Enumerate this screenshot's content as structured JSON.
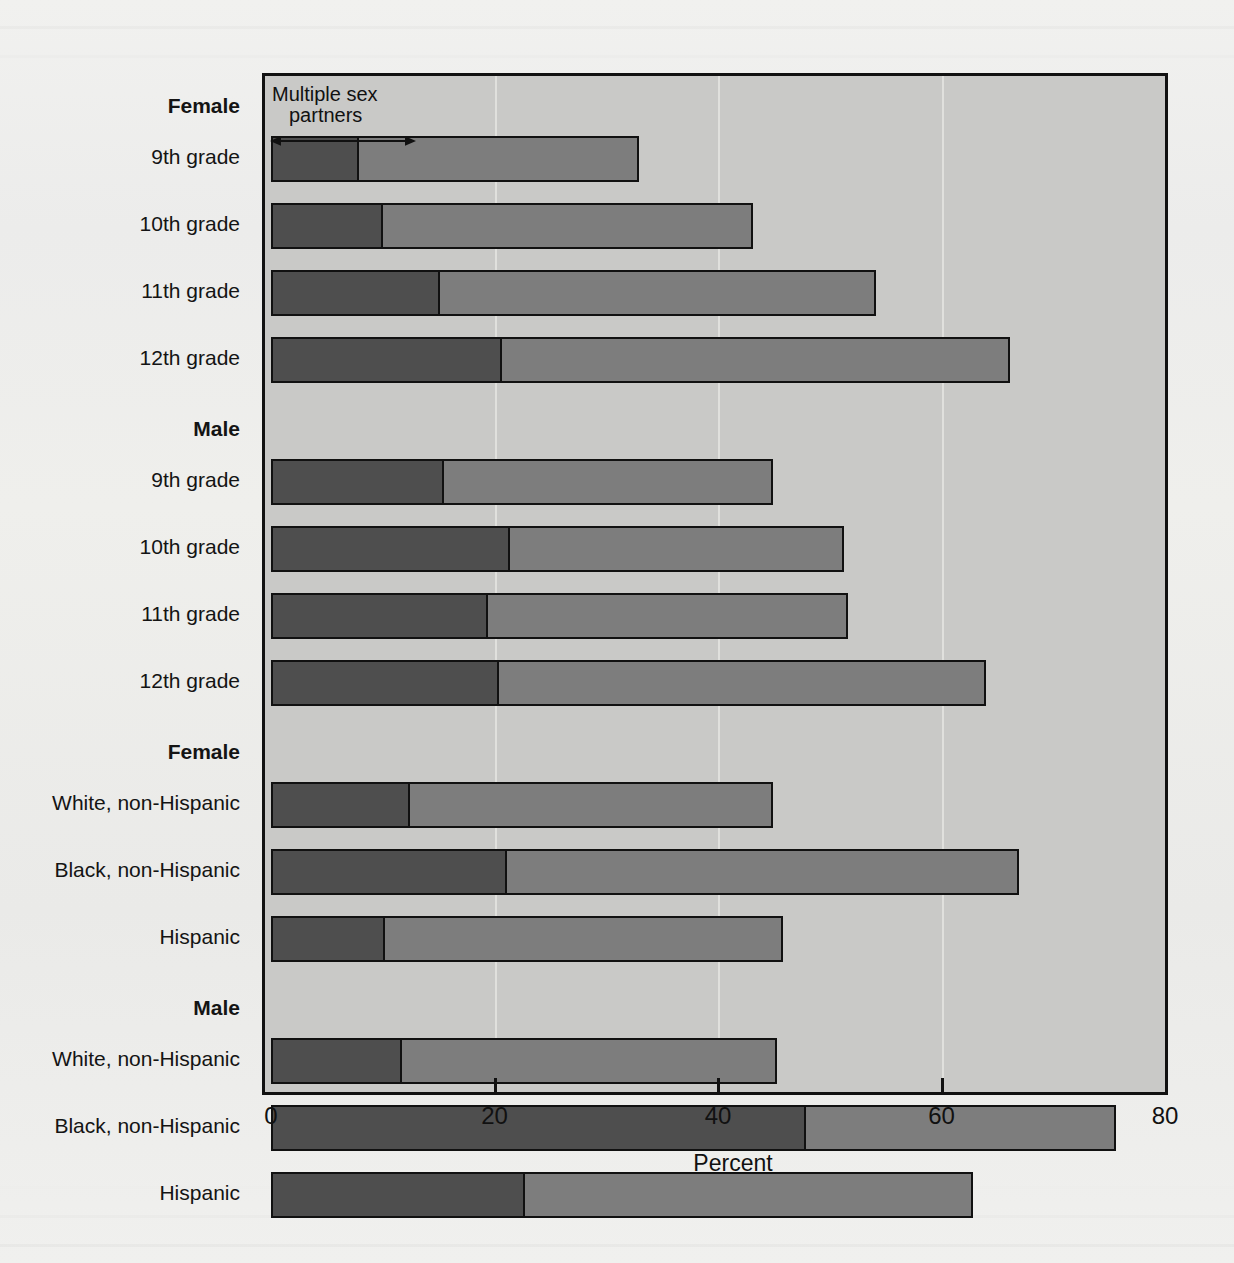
{
  "chart_data": {
    "type": "bar",
    "orientation": "horizontal",
    "stacked": true,
    "title": "",
    "xlabel": "Percent",
    "ylabel": "",
    "xlim": [
      0,
      80
    ],
    "xticks": [
      0,
      20,
      40,
      60,
      80
    ],
    "xtick_labels": [
      "0",
      "20",
      "40",
      "60",
      "80"
    ],
    "grid": true,
    "grid_axis": "x",
    "annotation": {
      "line1": "Multiple sex",
      "line2": "partners",
      "arrow": "double-headed",
      "arrow_from": 0,
      "arrow_to": 13
    },
    "series": [
      {
        "name": "Multiple sex partners",
        "color": "#4e4e4e"
      },
      {
        "name": "Ever had sexual intercourse",
        "color": "#7d7d7d"
      }
    ],
    "groups": [
      {
        "label": "Female",
        "rows": [
          {
            "label": "9th grade",
            "multiple_partners": 7.9,
            "total": 32.9
          },
          {
            "label": "10th grade",
            "multiple_partners": 10.0,
            "total": 43.1
          },
          {
            "label": "11th grade",
            "multiple_partners": 15.1,
            "total": 54.1
          },
          {
            "label": "12th grade",
            "multiple_partners": 20.7,
            "total": 66.1
          }
        ]
      },
      {
        "label": "Male",
        "rows": [
          {
            "label": "9th grade",
            "multiple_partners": 15.5,
            "total": 44.9
          },
          {
            "label": "10th grade",
            "multiple_partners": 21.4,
            "total": 51.3
          },
          {
            "label": "11th grade",
            "multiple_partners": 19.4,
            "total": 51.6
          },
          {
            "label": "12th grade",
            "multiple_partners": 20.4,
            "total": 64.0
          }
        ]
      },
      {
        "label": "Female",
        "rows": [
          {
            "label": "White, non-Hispanic",
            "multiple_partners": 12.4,
            "total": 44.9
          },
          {
            "label": "Black, non-Hispanic",
            "multiple_partners": 21.1,
            "total": 66.9
          },
          {
            "label": "Hispanic",
            "multiple_partners": 10.2,
            "total": 45.8
          }
        ]
      },
      {
        "label": "Male",
        "rows": [
          {
            "label": "White, non-Hispanic",
            "multiple_partners": 11.7,
            "total": 45.3
          },
          {
            "label": "Black, non-Hispanic",
            "multiple_partners": 47.9,
            "total": 75.6
          },
          {
            "label": "Hispanic",
            "multiple_partners": 22.7,
            "total": 62.8
          }
        ]
      }
    ]
  },
  "colors": {
    "multiple_partners": "#4e4e4e",
    "ever_intercourse": "#7d7d7d",
    "plot_background": "#c9c9c7",
    "page_background": "#efefed",
    "outline": "#111111"
  }
}
